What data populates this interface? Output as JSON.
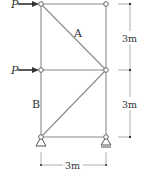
{
  "diagram": {
    "type": "truss",
    "loads": [
      {
        "label": "P",
        "node": "top-left",
        "direction": "right"
      },
      {
        "label": "P",
        "node": "middle-left",
        "direction": "right"
      }
    ],
    "members": [
      {
        "label": "A",
        "from": "top-left",
        "to": "middle-right"
      },
      {
        "label": "B",
        "from": "middle-left",
        "to": "bottom-left"
      }
    ],
    "dimensions": {
      "vertical_upper": "3m",
      "vertical_lower": "3m",
      "horizontal": "3m"
    },
    "supports": {
      "left": "pin",
      "right": "roller"
    },
    "colors": {
      "member": "#8a8a8a",
      "load": "#333333",
      "text": "#333333"
    }
  }
}
